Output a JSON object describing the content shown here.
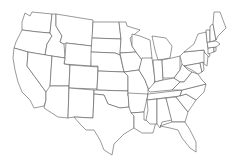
{
  "map": {
    "type": "blank-outline",
    "region": "United States (contiguous 48 states)",
    "background": "#ffffff",
    "stroke_color": "#555555",
    "fill_color": "#ffffff",
    "labels": []
  }
}
